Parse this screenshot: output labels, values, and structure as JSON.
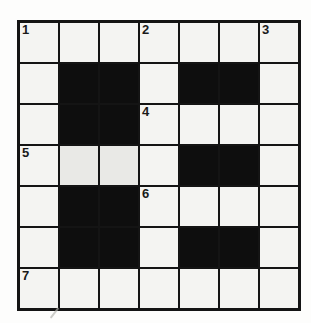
{
  "puzzle": {
    "name": "crossword-grid",
    "rows": 7,
    "cols": 7,
    "colors": {
      "cell_white": "#f4f4f2",
      "cell_black": "#0e0e0e",
      "grid_line": "#141414",
      "page_bg": "#fdfdfc"
    },
    "grid": [
      [
        "1",
        "",
        "",
        "2",
        "",
        "",
        "3"
      ],
      [
        "",
        "#",
        "#",
        "",
        "#",
        "#",
        ""
      ],
      [
        "",
        "#",
        "#",
        "4",
        "",
        "",
        ""
      ],
      [
        "5",
        "",
        "",
        "",
        "#",
        "#",
        ""
      ],
      [
        "",
        "#",
        "#",
        "6",
        "",
        "",
        ""
      ],
      [
        "",
        "#",
        "#",
        "",
        "#",
        "#",
        ""
      ],
      [
        "7",
        "",
        "",
        "",
        "",
        "",
        ""
      ]
    ],
    "shaded_cells": [
      "r4c2",
      "r4c3"
    ],
    "clue_numbers": [
      {
        "label": "1",
        "row": 1,
        "col": 1
      },
      {
        "label": "2",
        "row": 1,
        "col": 4
      },
      {
        "label": "3",
        "row": 1,
        "col": 7
      },
      {
        "label": "4",
        "row": 3,
        "col": 4
      },
      {
        "label": "5",
        "row": 4,
        "col": 1
      },
      {
        "label": "6",
        "row": 5,
        "col": 4
      },
      {
        "label": "7",
        "row": 7,
        "col": 1
      }
    ]
  }
}
